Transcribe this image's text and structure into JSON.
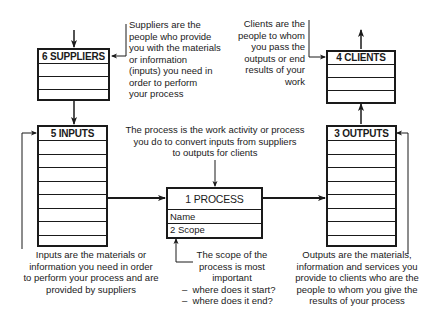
{
  "diagram": {
    "type": "process-model",
    "boxes": {
      "suppliers": {
        "title": "6 SUPPLIERS",
        "rows": [
          "",
          "",
          ""
        ]
      },
      "inputs": {
        "title": "5 INPUTS",
        "rows": [
          "",
          "",
          "",
          "",
          "",
          "",
          "",
          ""
        ]
      },
      "process": {
        "title": "1 PROCESS",
        "rows": [
          "Name",
          "2 Scope"
        ]
      },
      "outputs": {
        "title": "3 OUTPUTS",
        "rows": [
          "",
          "",
          "",
          "",
          "",
          "",
          "",
          ""
        ]
      },
      "clients": {
        "title": "4 CLIENTS",
        "rows": [
          "",
          "",
          ""
        ]
      }
    },
    "notes": {
      "suppliers": [
        "Suppliers are the",
        "people who provide",
        "you with the materials",
        "or information",
        "(inputs) you need in",
        "order to perform",
        "your process"
      ],
      "clients": [
        "Clients are the",
        "people to whom",
        "you pass the",
        "outputs or end",
        "results of your",
        "work"
      ],
      "process": [
        "The process is the work activity or process",
        "you do to convert inputs from suppliers",
        "to outputs for clients"
      ],
      "inputs": [
        "Inputs are the materials or",
        "information you need in order",
        "to perform your process and are",
        "provided by suppliers"
      ],
      "scope": [
        "The scope of the",
        "process is most",
        "important"
      ],
      "scope_bullets": [
        "where does it start?",
        "where does it end?"
      ],
      "outputs": [
        "Outputs are the materials,",
        "information and services you",
        "provide to clients who are the",
        "people to whom you give the",
        "results of your process"
      ]
    },
    "bullet_char": "–",
    "line_color": "#1a1a1a"
  }
}
